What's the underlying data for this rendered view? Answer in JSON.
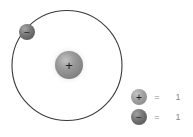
{
  "figure": {
    "background_color": "#ffffff"
  },
  "nucleus": {
    "name": "proton-nucleus",
    "symbol": "+",
    "center_x": 69,
    "center_y": 65,
    "radius": 14,
    "glow_radius": 20,
    "fill_color": "#8e8e8e",
    "highlight_color": "#b9b9b9",
    "glow_color": "#d6d6d6",
    "symbol_color": "#1c1c1c"
  },
  "orbit": {
    "name": "electron-orbit",
    "center_x": 67,
    "center_y": 65.5,
    "radius": 55,
    "stroke_color": "#3a3a3a",
    "stroke_width": 1.1
  },
  "electron": {
    "name": "electron-particle",
    "symbol": "−",
    "center_x": 27,
    "center_y": 32,
    "radius": 8,
    "fill_color": "#6d6d6d",
    "highlight_color": "#9d9d9d",
    "symbol_color": "#1f1f1f"
  },
  "legend": {
    "equals_label": "=",
    "rows": [
      {
        "id": "legend-proton",
        "particle": "proton",
        "symbol": "+",
        "equals": "=",
        "count": "1",
        "marker_fill": "#9a9a9a",
        "marker_highlight": "#bdbdbd",
        "marker_radius": 8,
        "center_x": 139,
        "center_y": 97
      },
      {
        "id": "legend-electron",
        "particle": "electron",
        "symbol": "−",
        "equals": "=",
        "count": "1",
        "marker_fill": "#6d6d6d",
        "marker_highlight": "#9a9a9a",
        "marker_radius": 8,
        "center_x": 139,
        "center_y": 117
      }
    ],
    "equals_x": 157,
    "count_x": 178,
    "text_color": "#8a8a8a"
  }
}
